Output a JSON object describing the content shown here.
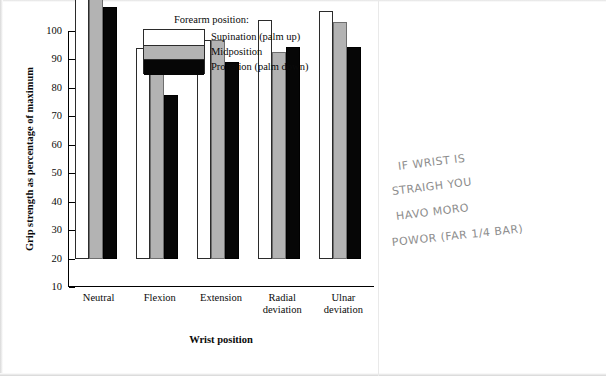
{
  "chart_data": {
    "type": "bar",
    "title": "",
    "xlabel": "Wrist position",
    "ylabel": "Grip strength as percentage of maximum",
    "categories": [
      "Neutral",
      "Flexion",
      "Extension",
      "Radial\ndeviation",
      "Ulnar\ndeviation"
    ],
    "legend_title": "Forearm position:",
    "legend_position": "top-center",
    "grid": false,
    "ylim": [
      0,
      100
    ],
    "yticks": [
      10,
      20,
      30,
      40,
      50,
      60,
      70,
      80,
      90,
      100
    ],
    "series": [
      {
        "name": "Supination (palm up)",
        "color": "#ffffff",
        "values": [
          100,
          74,
          77,
          84,
          87
        ]
      },
      {
        "name": "Midposition",
        "color": "#b3b3b3",
        "values": [
          98,
          70,
          77,
          72.5,
          83
        ]
      },
      {
        "name": "Pronation (palm down)",
        "color": "#060606",
        "values": [
          88.5,
          57.5,
          69,
          74.5,
          74.5
        ]
      }
    ]
  },
  "annotation": {
    "name": "handwritten-note",
    "lines": [
      "IF WRIST IS",
      "STRAIGH YOU",
      "HAVO MORO",
      "POWOR (FAR 1/4 BAR)"
    ]
  }
}
